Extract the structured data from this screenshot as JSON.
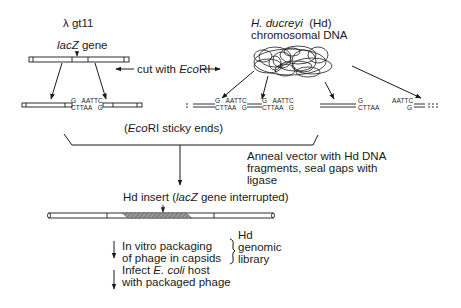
{
  "diagram": {
    "vector": {
      "name": "λ gt11",
      "gene_label_italic": "lacZ",
      "gene_label_rest": " gene"
    },
    "source_dna": {
      "organism_italic": "H. ducreyi",
      "abbrev": "(Hd)",
      "line2": "chromosomal DNA"
    },
    "cut_step": {
      "prefix": "cut with ",
      "enzyme_italic": "Eco",
      "enzyme_rest": "RI"
    },
    "sticky_ends": {
      "top": "G   AATTC",
      "bottom": "CTTAA   G",
      "top_left_only": "G",
      "bottom_left_only": "CTTAA",
      "top_right_only": "AATTC",
      "bottom_right_only": "G",
      "caption_open": "(",
      "caption_enzyme_italic": "Eco",
      "caption_rest": "RI  sticky ends)"
    },
    "anneal_step": {
      "lines": [
        "Anneal vector with Hd DNA",
        "fragments, seal gaps with",
        "ligase"
      ]
    },
    "recombinant": {
      "prefix": "Hd insert (",
      "gene_italic": "lacZ",
      "suffix": " gene interrupted)"
    },
    "final_steps": {
      "step1_line1": "In vitro packaging",
      "step1_line2": "of phage in capsids",
      "step2_line1_prefix": "Infect ",
      "step2_line1_italic": "E. coli",
      "step2_line1_suffix": " host",
      "step2_line2": "with packaged phage"
    },
    "library_bracket": {
      "lines": [
        "Hd",
        "genomic",
        "library"
      ]
    }
  }
}
